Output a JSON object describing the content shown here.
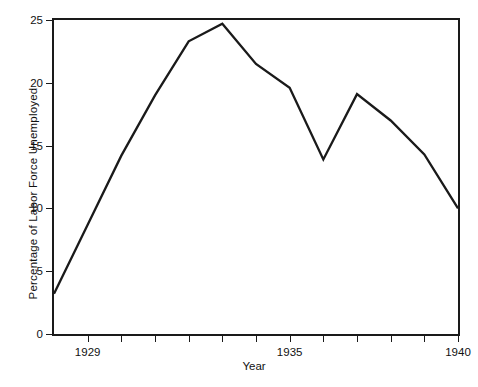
{
  "chart_data": {
    "type": "line",
    "title": "",
    "xlabel": "Year",
    "ylabel": "Percentage of Labor Force Unemployed",
    "xlim": [
      1928.0,
      1940.0
    ],
    "ylim": [
      0,
      25
    ],
    "grid": false,
    "legend": null,
    "line_color": "#1a1a1a",
    "axis_color": "#1a1a1a",
    "x": [
      1928,
      1929,
      1930,
      1931,
      1932,
      1933,
      1934,
      1935,
      1936,
      1937,
      1938,
      1939,
      1940
    ],
    "values": [
      3.2,
      8.7,
      14.2,
      19.0,
      23.3,
      24.7,
      21.5,
      19.6,
      13.9,
      19.1,
      17.0,
      14.3,
      10.0
    ],
    "series": [
      {
        "name": "Percentage of Labor Force Unemployed",
        "values": [
          3.2,
          8.7,
          14.2,
          19.0,
          23.3,
          24.7,
          21.5,
          19.6,
          13.9,
          19.1,
          17.0,
          14.3,
          10.0
        ]
      }
    ],
    "y_ticks": [
      0,
      5,
      10,
      15,
      20,
      25
    ],
    "y_tick_labels": [
      "0",
      "5",
      "10",
      "15",
      "20",
      "25"
    ],
    "x_ticks": [
      1929,
      1930,
      1931,
      1932,
      1933,
      1934,
      1935,
      1936,
      1937,
      1938,
      1939,
      1940
    ],
    "x_tick_labels": [
      "1929",
      "",
      "",
      "",
      "",
      "",
      "1935",
      "",
      "",
      "",
      "",
      "1940"
    ],
    "x_labeled_ticks": [
      {
        "value": 1929,
        "label": "1929"
      },
      {
        "value": 1935,
        "label": "1935"
      },
      {
        "value": 1940,
        "label": "1940"
      }
    ]
  }
}
